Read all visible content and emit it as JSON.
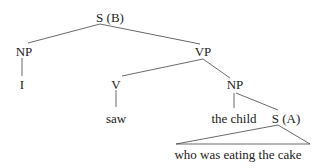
{
  "tree": {
    "root": "S (B)",
    "np_subject": "NP",
    "vp": "VP",
    "pronoun": "I",
    "verb_node": "V",
    "verb": "saw",
    "np_object": "NP",
    "object_head": "the child",
    "relative_clause_node": "S (A)",
    "relative_clause_text": "who was eating the cake"
  },
  "colors": {
    "line": "#333333",
    "text": "#222222",
    "background": "#ffffff"
  }
}
